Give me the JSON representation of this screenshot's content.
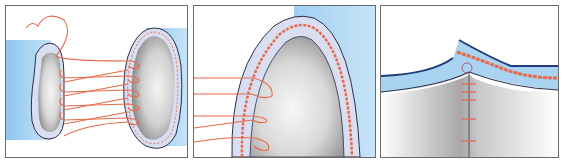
{
  "figure": {
    "panels": [
      {
        "id": "panel-1",
        "description": "Two vessel ends with interrupted sutures placed between them"
      },
      {
        "id": "panel-2",
        "description": "Close-up of vessel end with suture loops through the wall"
      },
      {
        "id": "panel-3",
        "description": "Completed anastomosis with sutures along the seam"
      }
    ],
    "colors": {
      "vessel_blue": "#a9d3f0",
      "vessel_wall": "#d9dff0",
      "outline": "#2a2f4a",
      "suture": "#e8694a",
      "lumen_light": "#f4f4f4",
      "lumen_dark": "#9a9a9a",
      "border": "#6b6b6b"
    }
  }
}
